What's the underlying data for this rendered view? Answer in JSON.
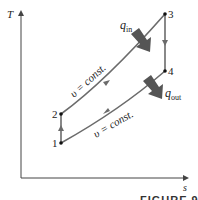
{
  "figure": {
    "caption": "FIGURE 9–15",
    "axes": {
      "y_label": "T",
      "x_label": "s"
    },
    "points": [
      {
        "id": "1",
        "label": "1"
      },
      {
        "id": "2",
        "label": "2"
      },
      {
        "id": "3",
        "label": "3"
      },
      {
        "id": "4",
        "label": "4"
      }
    ],
    "processes": {
      "upper": "υ = const.",
      "lower": "υ = const."
    },
    "heat": {
      "in_symbol": "q",
      "in_sub": "in",
      "out_symbol": "q",
      "out_sub": "out"
    },
    "colors": {
      "line": "#6b6b6b",
      "arrow": "#555555",
      "axis": "#444444"
    }
  }
}
